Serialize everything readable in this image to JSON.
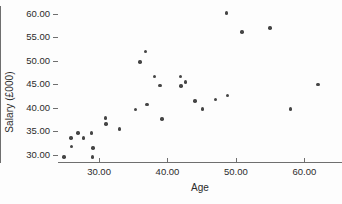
{
  "chart_data": {
    "type": "scatter",
    "title": "",
    "xlabel": "Age",
    "ylabel": "Salary (£000)",
    "xlim": [
      24.0,
      65.5
    ],
    "ylim": [
      28.2,
      61.6
    ],
    "grid": false,
    "legend": "none",
    "marker_color": "#454545",
    "axis_color": "#6f6f6f",
    "xticks": [
      30,
      40,
      50,
      60
    ],
    "xtick_labels": [
      "30.00",
      "40.00",
      "50.00",
      "60.00"
    ],
    "yticks": [
      30,
      35,
      40,
      45,
      50,
      55,
      60
    ],
    "ytick_labels": [
      "30.00",
      "35.00",
      "40.00",
      "45.00",
      "50.00",
      "55.00",
      "60.00"
    ],
    "points": [
      {
        "x": 24.9,
        "y": 29.5
      },
      {
        "x": 25.9,
        "y": 33.5
      },
      {
        "x": 26.0,
        "y": 31.7
      },
      {
        "x": 26.9,
        "y": 34.6
      },
      {
        "x": 27.7,
        "y": 33.5
      },
      {
        "x": 28.9,
        "y": 34.6
      },
      {
        "x": 29.0,
        "y": 29.5
      },
      {
        "x": 29.1,
        "y": 31.4
      },
      {
        "x": 30.9,
        "y": 37.8
      },
      {
        "x": 31.0,
        "y": 36.5
      },
      {
        "x": 33.0,
        "y": 35.4
      },
      {
        "x": 35.3,
        "y": 39.6
      },
      {
        "x": 36.0,
        "y": 49.7
      },
      {
        "x": 36.8,
        "y": 51.9
      },
      {
        "x": 37.0,
        "y": 40.6
      },
      {
        "x": 38.1,
        "y": 46.6
      },
      {
        "x": 38.9,
        "y": 44.7
      },
      {
        "x": 39.2,
        "y": 37.6
      },
      {
        "x": 41.9,
        "y": 46.6
      },
      {
        "x": 42.0,
        "y": 44.6
      },
      {
        "x": 42.6,
        "y": 45.4
      },
      {
        "x": 44.0,
        "y": 41.4
      },
      {
        "x": 45.1,
        "y": 39.7
      },
      {
        "x": 47.0,
        "y": 41.7
      },
      {
        "x": 48.6,
        "y": 60.1
      },
      {
        "x": 48.8,
        "y": 42.6
      },
      {
        "x": 50.9,
        "y": 56.1
      },
      {
        "x": 55.0,
        "y": 56.9
      },
      {
        "x": 58.0,
        "y": 39.7
      },
      {
        "x": 62.0,
        "y": 44.9
      }
    ]
  }
}
